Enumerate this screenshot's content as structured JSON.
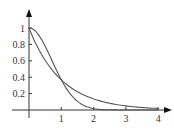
{
  "chart_data": {
    "type": "line",
    "title": "",
    "xlabel": "",
    "ylabel": "",
    "xlim": [
      0,
      4
    ],
    "ylim": [
      0,
      1
    ],
    "grid": false,
    "legend": null,
    "x_ticks": [
      "1",
      "2",
      "3",
      "4"
    ],
    "y_ticks": [
      "0.2",
      "0.4",
      "0.6",
      "0.8",
      "1"
    ],
    "series": [
      {
        "name": "e^(-x)",
        "x": [
          0,
          0.5,
          1,
          1.5,
          2,
          2.5,
          3,
          3.5,
          4
        ],
        "values": [
          1,
          0.61,
          0.37,
          0.22,
          0.14,
          0.08,
          0.05,
          0.03,
          0.02
        ]
      },
      {
        "name": "e^(-x^2)",
        "x": [
          0,
          0.25,
          0.5,
          0.75,
          1,
          1.25,
          1.5,
          2,
          2.5
        ],
        "values": [
          1,
          0.94,
          0.78,
          0.57,
          0.37,
          0.21,
          0.11,
          0.02,
          0.0
        ]
      }
    ],
    "colors": {
      "axis": "#333333",
      "curve": "#555555"
    }
  }
}
